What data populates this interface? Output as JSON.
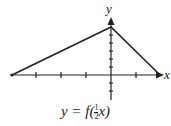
{
  "diagram": {
    "x_axis_label": "x",
    "y_axis_label": "y",
    "caption_prefix": "y = f(",
    "caption_frac_num": "1",
    "caption_frac_den": "2",
    "caption_suffix": "x)",
    "graph_points": [
      [
        -4,
        0
      ],
      [
        0,
        6
      ],
      [
        2,
        0
      ]
    ],
    "x_ticks": [
      -4,
      -3,
      -2,
      -1,
      0,
      1,
      2
    ],
    "y_ticks": [
      -2,
      -1,
      0,
      1,
      2,
      3,
      4,
      5,
      6
    ],
    "line_color": "#222222"
  }
}
